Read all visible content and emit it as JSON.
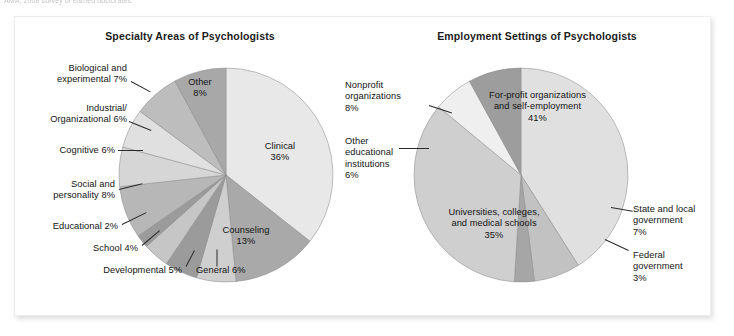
{
  "caption": {
    "text": "AMA, 2008 survey of earned doctorates."
  },
  "figure": {
    "charts": [
      {
        "id": "specialty",
        "title": "Specialty Areas of Psychologists"
      },
      {
        "id": "employment",
        "title": "Employment Settings of Psychologists"
      }
    ]
  },
  "chart_data": [
    {
      "type": "pie",
      "title": "Specialty Areas of Psychologists",
      "xlabel": "",
      "ylabel": "",
      "legend": "none (direct labels with leader lines)",
      "grid": false,
      "units": "percent",
      "start_angle_deg": 0,
      "direction": "clockwise",
      "categories": [
        "Clinical",
        "Counseling",
        "General",
        "Developmental",
        "School",
        "Educational",
        "Social and personality",
        "Cognitive",
        "Industrial/ Organizational",
        "Biological and experimental",
        "Other"
      ],
      "values": [
        36,
        13,
        6,
        5,
        4,
        2,
        8,
        6,
        6,
        7,
        8
      ],
      "slices": [
        {
          "label": "Clinical",
          "value": 36,
          "value_text": "36%",
          "color": "#e8e8e8",
          "label_placement": "inside"
        },
        {
          "label": "Counseling",
          "value": 13,
          "value_text": "13%",
          "color": "#a9a9a9",
          "label_placement": "inside"
        },
        {
          "label": "General",
          "value": 6,
          "value_text": "6%",
          "color": "#cfcfcf",
          "label_placement": "outside"
        },
        {
          "label": "Developmental",
          "value": 5,
          "value_text": "5%",
          "color": "#9b9b9b",
          "label_placement": "outside"
        },
        {
          "label": "School",
          "value": 4,
          "value_text": "4%",
          "color": "#c6c6c6",
          "label_placement": "outside"
        },
        {
          "label": "Educational",
          "value": 2,
          "value_text": "2%",
          "color": "#9b9b9b",
          "label_placement": "outside"
        },
        {
          "label": "Social and personality",
          "value": 8,
          "value_text": "8%",
          "color": "#b7b7b7",
          "label_placement": "outside"
        },
        {
          "label": "Cognitive",
          "value": 6,
          "value_text": "6%",
          "color": "#d6d6d6",
          "label_placement": "outside"
        },
        {
          "label": "Industrial/ Organizational",
          "value": 6,
          "value_text": "6%",
          "color": "#e0e0e0",
          "label_placement": "outside"
        },
        {
          "label": "Biological and experimental",
          "value": 7,
          "value_text": "7%",
          "color": "#bdbdbd",
          "label_placement": "outside"
        },
        {
          "label": "Other",
          "value": 8,
          "value_text": "8%",
          "color": "#a8a8a8",
          "label_placement": "inside"
        }
      ]
    },
    {
      "type": "pie",
      "title": "Employment Settings of Psychologists",
      "xlabel": "",
      "ylabel": "",
      "legend": "none (direct labels with leader lines)",
      "grid": false,
      "units": "percent",
      "start_angle_deg": 0,
      "direction": "clockwise",
      "categories": [
        "For-profit organizations and self-employment",
        "State and local government",
        "Federal government",
        "Universities, colleges, and medical schools",
        "Other educational institutions",
        "Nonprofit organizations"
      ],
      "values": [
        41,
        7,
        3,
        35,
        6,
        8
      ],
      "slices": [
        {
          "label": "For-profit organizations and self-employment",
          "value": 41,
          "value_text": "41%",
          "color": "#e0e0e0",
          "label_placement": "inside"
        },
        {
          "label": "State and local government",
          "value": 7,
          "value_text": "7%",
          "color": "#c2c2c2",
          "label_placement": "outside"
        },
        {
          "label": "Federal government",
          "value": 3,
          "value_text": "3%",
          "color": "#a6a6a6",
          "label_placement": "outside"
        },
        {
          "label": "Universities, colleges, and medical schools",
          "value": 35,
          "value_text": "35%",
          "color": "#cfcfcf",
          "label_placement": "inside"
        },
        {
          "label": "Other educational institutions",
          "value": 6,
          "value_text": "6%",
          "color": "#efefef",
          "label_placement": "outside"
        },
        {
          "label": "Nonprofit organizations",
          "value": 8,
          "value_text": "8%",
          "color": "#9d9d9d",
          "label_placement": "outside"
        }
      ]
    }
  ],
  "labels": {
    "left": {
      "biological_l1": "Biological and",
      "biological_l2": "experimental 7%",
      "industrial_l1": "Industrial/",
      "industrial_l2": "Organizational 6%",
      "cognitive": "Cognitive 6%",
      "social_l1": "Social and",
      "social_l2": "personality 8%",
      "educational": "Educational 2%",
      "school": "School 4%",
      "developmental": "Developmental 5%",
      "general": "General 6%",
      "other_l1": "Other",
      "other_l2": "8%",
      "clinical_l1": "Clinical",
      "clinical_l2": "36%",
      "counseling_l1": "Counseling",
      "counseling_l2": "13%"
    },
    "right": {
      "nonprofit_l1": "Nonprofit",
      "nonprofit_l2": "organizations",
      "nonprofit_l3": "8%",
      "othered_l1": "Other",
      "othered_l2": "educational",
      "othered_l3": "institutions",
      "othered_l4": "6%",
      "forprofit_l1": "For-profit organizations",
      "forprofit_l2": "and self-employment",
      "forprofit_l3": "41%",
      "universities_l1": "Universities, colleges,",
      "universities_l2": "and medical schools",
      "universities_l3": "35%",
      "statelocal_l1": "State and local",
      "statelocal_l2": "government",
      "statelocal_l3": "7%",
      "federal_l1": "Federal",
      "federal_l2": "government",
      "federal_l3": "3%"
    }
  },
  "colors": {
    "panel_background": "#ffffff",
    "panel_border": "#ededed",
    "text": "#141414",
    "title": "#1b1b1b",
    "pie_stroke": "#8c8c8c"
  }
}
